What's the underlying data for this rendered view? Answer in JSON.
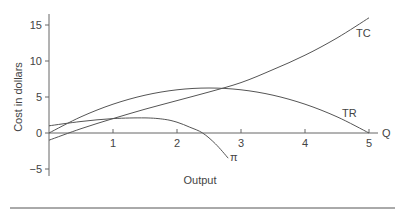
{
  "chart_data": {
    "type": "line",
    "title": "",
    "xlabel": "Output",
    "ylabel": "Cost in dollars",
    "x_axis_end_label": "Q",
    "xlim": [
      0,
      5.3
    ],
    "ylim": [
      -6,
      17
    ],
    "x_ticks": [
      1,
      2,
      3,
      4,
      5
    ],
    "x_tick_labels": [
      "1",
      "2",
      "3",
      "4",
      "5"
    ],
    "y_ticks": [
      15,
      10,
      5,
      0,
      -5
    ],
    "y_tick_labels": [
      "15",
      "10",
      "5",
      "0",
      "−5"
    ],
    "grid": false,
    "legend": "inline labels at curve ends",
    "series": [
      {
        "name": "TC",
        "label": "TC",
        "x": [
          0,
          0.5,
          1,
          1.5,
          2,
          2.5,
          3,
          3.5,
          4,
          4.5,
          5
        ],
        "y": [
          -1,
          0.6,
          2,
          3.3,
          4.5,
          5.7,
          7,
          8.8,
          10.8,
          13.2,
          16
        ]
      },
      {
        "name": "TR",
        "label": "TR",
        "x": [
          0,
          0.5,
          1,
          1.5,
          2,
          2.5,
          3,
          3.5,
          4,
          4.5,
          5
        ],
        "y": [
          0,
          2.25,
          4,
          5.25,
          6,
          6.25,
          6,
          5.25,
          4,
          2.25,
          0
        ]
      },
      {
        "name": "Profit",
        "label": "π",
        "x": [
          0,
          0.5,
          1,
          1.5,
          1.8,
          2,
          2.2,
          2.4,
          2.6,
          2.8
        ],
        "y": [
          1,
          1.6,
          2,
          2.1,
          1.9,
          1.5,
          0.8,
          0,
          -1.5,
          -3.5
        ]
      }
    ]
  },
  "labels": {
    "ylabel": "Cost in dollars",
    "xlabel": "Output",
    "q": "Q",
    "tc": "TC",
    "tr": "TR",
    "pi": "π"
  }
}
